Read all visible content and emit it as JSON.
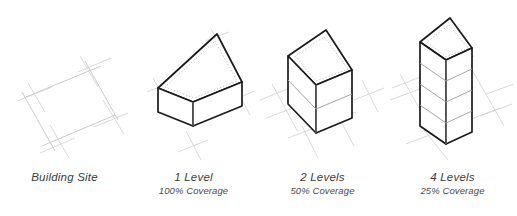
{
  "figure": {
    "background_color": "#ffffff",
    "line_color_site": "#bfbfbf",
    "line_color_outline": "#1a1a1a",
    "line_color_inner": "#9a9a9a",
    "line_color_dotted": "#b3b3b3",
    "face_fill": "#ffffff"
  },
  "panels": [
    {
      "id": "building-site",
      "title": "Building Site",
      "subtitle": "",
      "levels": 0,
      "coverage": "",
      "footprint_fraction": 1.0
    },
    {
      "id": "one-level",
      "title": "1 Level",
      "subtitle": "100% Coverage",
      "levels": 1,
      "coverage": "100%",
      "footprint_fraction": 1.0
    },
    {
      "id": "two-levels",
      "title": "2 Levels",
      "subtitle": "50% Coverage",
      "levels": 2,
      "coverage": "50%",
      "footprint_fraction": 0.5
    },
    {
      "id": "four-levels",
      "title": "4 Levels",
      "subtitle": "25% Coverage",
      "levels": 4,
      "coverage": "25%",
      "footprint_fraction": 0.25
    }
  ]
}
